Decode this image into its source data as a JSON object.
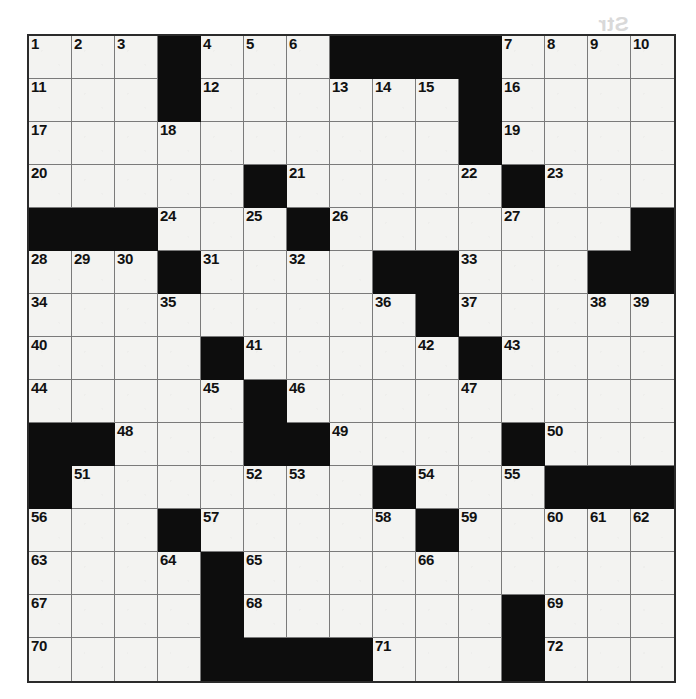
{
  "puzzle": {
    "kind": "crossword-grid",
    "size": {
      "columns": 15,
      "rows": 15
    },
    "colors": {
      "block": "#0d0d0d",
      "white": "#f3f3f1",
      "grid_line": "#7a7a7a",
      "border": "#2b2b2b",
      "number": "#111111"
    },
    "blocks": [
      [
        0,
        3
      ],
      [
        0,
        7
      ],
      [
        0,
        8
      ],
      [
        0,
        9
      ],
      [
        0,
        10
      ],
      [
        1,
        3
      ],
      [
        1,
        10
      ],
      [
        2,
        10
      ],
      [
        3,
        5
      ],
      [
        3,
        11
      ],
      [
        4,
        0
      ],
      [
        4,
        1
      ],
      [
        4,
        2
      ],
      [
        4,
        6
      ],
      [
        4,
        14
      ],
      [
        5,
        3
      ],
      [
        5,
        8
      ],
      [
        5,
        9
      ],
      [
        5,
        13
      ],
      [
        5,
        14
      ],
      [
        6,
        9
      ],
      [
        7,
        4
      ],
      [
        7,
        10
      ],
      [
        8,
        5
      ],
      [
        9,
        0
      ],
      [
        9,
        1
      ],
      [
        9,
        5
      ],
      [
        9,
        6
      ],
      [
        9,
        11
      ],
      [
        10,
        0
      ],
      [
        10,
        8
      ],
      [
        10,
        12
      ],
      [
        10,
        13
      ],
      [
        10,
        14
      ],
      [
        11,
        3
      ],
      [
        11,
        9
      ],
      [
        12,
        4
      ],
      [
        13,
        4
      ],
      [
        13,
        11
      ],
      [
        14,
        4
      ],
      [
        14,
        5
      ],
      [
        14,
        6
      ],
      [
        14,
        7
      ],
      [
        14,
        11
      ]
    ],
    "numbers": [
      {
        "n": "1",
        "row": 0,
        "col": 0
      },
      {
        "n": "2",
        "row": 0,
        "col": 1
      },
      {
        "n": "3",
        "row": 0,
        "col": 2
      },
      {
        "n": "4",
        "row": 0,
        "col": 4
      },
      {
        "n": "5",
        "row": 0,
        "col": 5
      },
      {
        "n": "6",
        "row": 0,
        "col": 6
      },
      {
        "n": "7",
        "row": 0,
        "col": 11
      },
      {
        "n": "8",
        "row": 0,
        "col": 12
      },
      {
        "n": "9",
        "row": 0,
        "col": 13
      },
      {
        "n": "10",
        "row": 0,
        "col": 14
      },
      {
        "n": "11",
        "row": 1,
        "col": 0
      },
      {
        "n": "12",
        "row": 1,
        "col": 4
      },
      {
        "n": "13",
        "row": 1,
        "col": 7
      },
      {
        "n": "14",
        "row": 1,
        "col": 8
      },
      {
        "n": "15",
        "row": 1,
        "col": 9
      },
      {
        "n": "16",
        "row": 1,
        "col": 11
      },
      {
        "n": "17",
        "row": 2,
        "col": 0
      },
      {
        "n": "18",
        "row": 2,
        "col": 3
      },
      {
        "n": "19",
        "row": 2,
        "col": 11
      },
      {
        "n": "20",
        "row": 3,
        "col": 0
      },
      {
        "n": "21",
        "row": 3,
        "col": 6
      },
      {
        "n": "22",
        "row": 3,
        "col": 10
      },
      {
        "n": "23",
        "row": 3,
        "col": 12
      },
      {
        "n": "24",
        "row": 4,
        "col": 3
      },
      {
        "n": "25",
        "row": 4,
        "col": 5
      },
      {
        "n": "26",
        "row": 4,
        "col": 7
      },
      {
        "n": "27",
        "row": 4,
        "col": 11
      },
      {
        "n": "28",
        "row": 5,
        "col": 0
      },
      {
        "n": "29",
        "row": 5,
        "col": 1
      },
      {
        "n": "30",
        "row": 5,
        "col": 2
      },
      {
        "n": "31",
        "row": 5,
        "col": 4
      },
      {
        "n": "32",
        "row": 5,
        "col": 6
      },
      {
        "n": "33",
        "row": 5,
        "col": 10
      },
      {
        "n": "34",
        "row": 6,
        "col": 0
      },
      {
        "n": "35",
        "row": 6,
        "col": 3
      },
      {
        "n": "36",
        "row": 6,
        "col": 8
      },
      {
        "n": "37",
        "row": 6,
        "col": 10
      },
      {
        "n": "38",
        "row": 6,
        "col": 13
      },
      {
        "n": "39",
        "row": 6,
        "col": 14
      },
      {
        "n": "40",
        "row": 7,
        "col": 0
      },
      {
        "n": "41",
        "row": 7,
        "col": 5
      },
      {
        "n": "42",
        "row": 7,
        "col": 9
      },
      {
        "n": "43",
        "row": 7,
        "col": 11
      },
      {
        "n": "44",
        "row": 8,
        "col": 0
      },
      {
        "n": "45",
        "row": 8,
        "col": 4
      },
      {
        "n": "46",
        "row": 8,
        "col": 6
      },
      {
        "n": "47",
        "row": 8,
        "col": 10
      },
      {
        "n": "48",
        "row": 9,
        "col": 2
      },
      {
        "n": "49",
        "row": 9,
        "col": 7
      },
      {
        "n": "50",
        "row": 9,
        "col": 12
      },
      {
        "n": "51",
        "row": 10,
        "col": 1
      },
      {
        "n": "52",
        "row": 10,
        "col": 5
      },
      {
        "n": "53",
        "row": 10,
        "col": 6
      },
      {
        "n": "54",
        "row": 10,
        "col": 9
      },
      {
        "n": "55",
        "row": 10,
        "col": 11
      },
      {
        "n": "56",
        "row": 11,
        "col": 0
      },
      {
        "n": "57",
        "row": 11,
        "col": 4
      },
      {
        "n": "58",
        "row": 11,
        "col": 8
      },
      {
        "n": "59",
        "row": 11,
        "col": 10
      },
      {
        "n": "60",
        "row": 11,
        "col": 12
      },
      {
        "n": "61",
        "row": 11,
        "col": 13
      },
      {
        "n": "62",
        "row": 11,
        "col": 14
      },
      {
        "n": "63",
        "row": 12,
        "col": 0
      },
      {
        "n": "64",
        "row": 12,
        "col": 3
      },
      {
        "n": "65",
        "row": 12,
        "col": 5
      },
      {
        "n": "66",
        "row": 12,
        "col": 9
      },
      {
        "n": "67",
        "row": 13,
        "col": 0
      },
      {
        "n": "68",
        "row": 13,
        "col": 5
      },
      {
        "n": "69",
        "row": 13,
        "col": 12
      },
      {
        "n": "70",
        "row": 14,
        "col": 0
      },
      {
        "n": "71",
        "row": 14,
        "col": 8
      },
      {
        "n": "72",
        "row": 14,
        "col": 12
      }
    ]
  },
  "showthrough": {
    "note": "faint mirrored bleed-through text from the reverse side of the page",
    "lines": [
      "Str",
      "ous",
      "Dei",
      "ice",
      "eds",
      "ter",
      "Patr",
      "Cor"
    ]
  }
}
